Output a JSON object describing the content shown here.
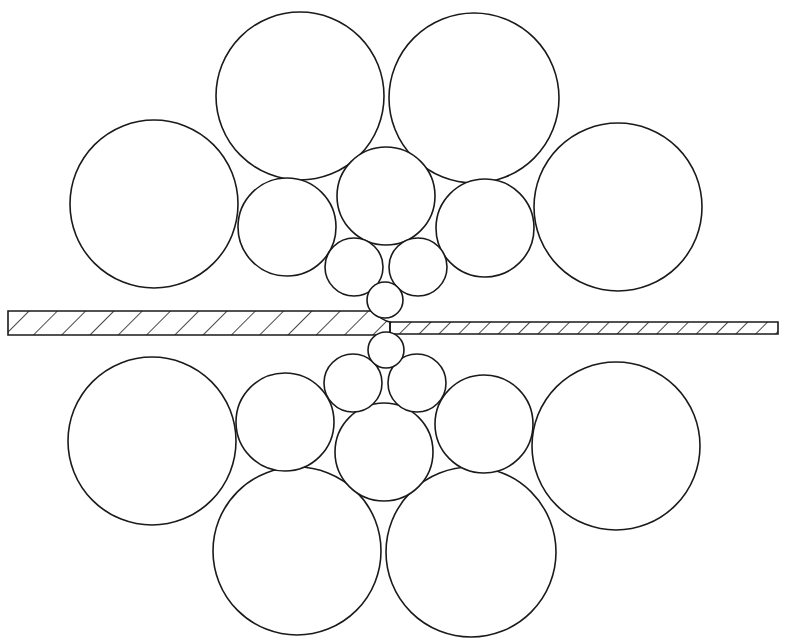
{
  "diagram": {
    "background": "#ffffff",
    "stroke_color": "#1a1a1a",
    "strip": {
      "label": "strip",
      "direction": "left-to-right",
      "entry": {
        "x_start": 8,
        "x_end": 372,
        "y_top": 311,
        "y_bottom": 335,
        "hatch_spacing": 20
      },
      "exit": {
        "x_start": 390,
        "x_end": 778,
        "y_top": 322,
        "y_bottom": 334,
        "hatch_spacing": 14
      }
    },
    "upper_stack": {
      "work_roll": {
        "cx": 385,
        "cy": 300,
        "r": 18
      },
      "first_intermediate": [
        {
          "cx": 354,
          "cy": 267,
          "r": 29
        },
        {
          "cx": 418,
          "cy": 267,
          "r": 29
        }
      ],
      "second_intermediate": [
        {
          "cx": 287,
          "cy": 227,
          "r": 49
        },
        {
          "cx": 386,
          "cy": 196,
          "r": 49
        },
        {
          "cx": 485,
          "cy": 228,
          "r": 49
        }
      ],
      "backup": [
        {
          "cx": 154,
          "cy": 204,
          "r": 84
        },
        {
          "cx": 300,
          "cy": 96,
          "r": 84
        },
        {
          "cx": 474,
          "cy": 98,
          "r": 85
        },
        {
          "cx": 618,
          "cy": 207,
          "r": 84
        }
      ]
    },
    "lower_stack": {
      "work_roll": {
        "cx": 386,
        "cy": 350,
        "r": 18
      },
      "first_intermediate": [
        {
          "cx": 353,
          "cy": 383,
          "r": 29
        },
        {
          "cx": 417,
          "cy": 383,
          "r": 29
        }
      ],
      "second_intermediate": [
        {
          "cx": 285,
          "cy": 422,
          "r": 49
        },
        {
          "cx": 384,
          "cy": 452,
          "r": 49
        },
        {
          "cx": 484,
          "cy": 424,
          "r": 49
        }
      ],
      "backup": [
        {
          "cx": 152,
          "cy": 441,
          "r": 84
        },
        {
          "cx": 297,
          "cy": 551,
          "r": 84
        },
        {
          "cx": 471,
          "cy": 552,
          "r": 85
        },
        {
          "cx": 616,
          "cy": 446,
          "r": 84
        }
      ]
    }
  }
}
